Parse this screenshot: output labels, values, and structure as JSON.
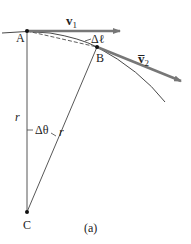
{
  "figure": {
    "caption": "(a)",
    "points": {
      "A": {
        "label": "A",
        "x": 27,
        "y": 31
      },
      "B": {
        "label": "B",
        "x": 97,
        "y": 47
      },
      "C": {
        "label": "C",
        "x": 27,
        "y": 212
      }
    },
    "vectors": {
      "v1": {
        "label": "v",
        "subscript": "1"
      },
      "v2": {
        "label": "v̅",
        "subscript": "2"
      }
    },
    "arc_length_label": "Δℓ",
    "angle_label": "Δθ",
    "radius_label_left": "r",
    "radius_label_right": "r",
    "colors": {
      "arrow": "#777777",
      "line": "#333333",
      "background": "#ffffff"
    }
  }
}
